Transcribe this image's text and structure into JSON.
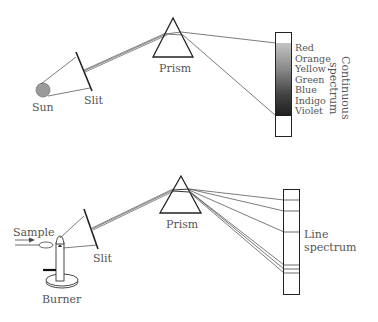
{
  "top_diagram": {
    "source_label": "Sun",
    "slit_label": "Slit",
    "prism_label": "Prism",
    "spectrum_colors": [
      "Red",
      "Orange",
      "Yellow",
      "Green",
      "Blue",
      "Indigo",
      "Violet"
    ],
    "spectrum_title_line1": "Continuous",
    "spectrum_title_line2": "spectrum"
  },
  "bottom_diagram": {
    "sample_label": "Sample",
    "burner_label": "Burner",
    "slit_label": "Slit",
    "prism_label": "Prism",
    "spectrum_title_line1": "Line",
    "spectrum_title_line2": "spectrum"
  },
  "colors": {
    "line": "#333333",
    "text": "#555555",
    "sun": "#9a9a9a",
    "spectrum_top": "#bdbdbd",
    "spectrum_bottom": "#1e1e1e"
  }
}
